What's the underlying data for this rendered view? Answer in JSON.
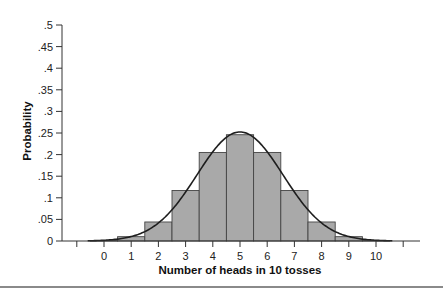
{
  "chart_data": {
    "type": "bar",
    "title": "",
    "xlabel": "Number of heads in 10 tosses",
    "ylabel": "Probability",
    "categories": [
      0,
      1,
      2,
      3,
      4,
      5,
      6,
      7,
      8,
      9,
      10
    ],
    "values": [
      0.001,
      0.01,
      0.044,
      0.117,
      0.205,
      0.246,
      0.205,
      0.117,
      0.044,
      0.01,
      0.001
    ],
    "overlay": {
      "type": "line",
      "name": "Normal approximation",
      "mean": 5,
      "sd": 1.581
    },
    "ylim": [
      0,
      0.5
    ],
    "xlim": [
      -1,
      11
    ],
    "yticks": [
      0,
      0.05,
      0.1,
      0.15,
      0.2,
      0.25,
      0.3,
      0.35,
      0.4,
      0.45,
      0.5
    ],
    "ytick_labels": [
      "0",
      ".05",
      ".1",
      ".15",
      ".2",
      ".25",
      ".3",
      ".35",
      ".4",
      ".45",
      ".5"
    ],
    "xticks": [
      -1,
      0,
      1,
      2,
      3,
      4,
      5,
      6,
      7,
      8,
      9,
      10,
      11
    ],
    "xtick_labels": [
      "",
      "0",
      "1",
      "2",
      "3",
      "4",
      "5",
      "6",
      "7",
      "8",
      "9",
      "10",
      ""
    ],
    "grid": false,
    "legend": null
  },
  "colors": {
    "bar_fill": "#a9a9a9",
    "bar_stroke": "#444444",
    "curve": "#1e1e1e",
    "axis": "#333333"
  }
}
